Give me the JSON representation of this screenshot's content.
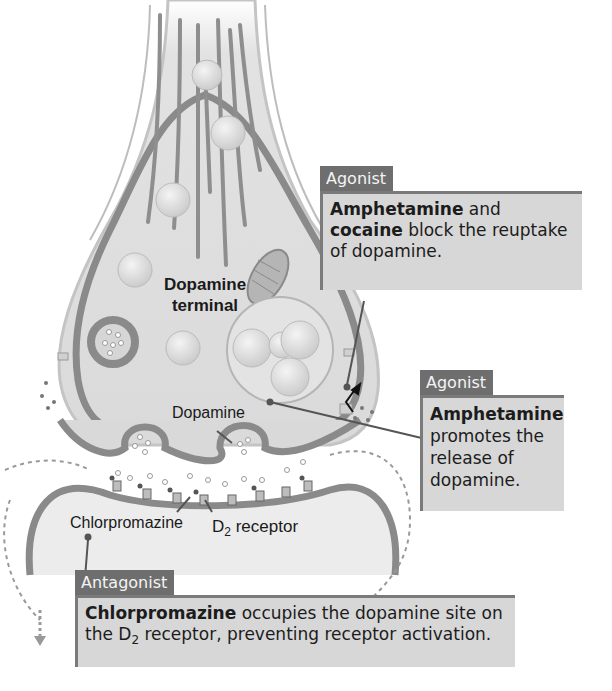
{
  "diagram": {
    "title": "Dopamine terminal",
    "terminal_label_line1": "Dopamine",
    "terminal_label_line2": "terminal",
    "labels": {
      "dopamine": "Dopamine",
      "chlorpromazine": "Chlorpromazine",
      "d2_receptor_prefix": "D",
      "d2_receptor_sub": "2",
      "d2_receptor_suffix": " receptor"
    }
  },
  "callouts": [
    {
      "tag": "Agonist",
      "bold1": "Amphetamine",
      "text1": " and ",
      "bold2": "cocaine",
      "text2": " block the reuptake of dopamine."
    },
    {
      "tag": "Agonist",
      "bold1": "Amphetamine",
      "text1": " promotes the release of dopamine."
    },
    {
      "tag": "Antagonist",
      "bold1": "Chlorpromazine",
      "text1": " occupies the dopamine site on the D",
      "sub": "2",
      "text2": " receptor, preventing receptor activation."
    }
  ],
  "colors": {
    "tag_bg": "#6e6e6e",
    "box_bg": "#d7d7d7",
    "membrane": "#8a8a8a",
    "cytoplasm": "#dcdcdc"
  }
}
